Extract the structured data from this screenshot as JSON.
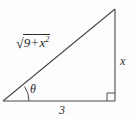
{
  "figure": {
    "kind": "right-triangle-diagram",
    "background_color": "#fdfdfd",
    "stroke_color": "#4a4a4a",
    "text_color": "#2b2b2b",
    "labels": {
      "hypotenuse": {
        "text": "√(9 + x²)",
        "radical_sign": "√",
        "radicand_first": "9",
        "radicand_operator": "+",
        "radicand_second": "x",
        "radicand_second_exponent": "2"
      },
      "opposite_side": "x",
      "adjacent_side": "3",
      "angle": "θ"
    },
    "geometry": {
      "vertex_left": [
        3,
        101
      ],
      "vertex_right": [
        115,
        101
      ],
      "vertex_top": [
        115,
        9
      ],
      "right_angle_marker": true,
      "right_angle_marker_size": 8,
      "angle_arc_radius": 26
    }
  }
}
